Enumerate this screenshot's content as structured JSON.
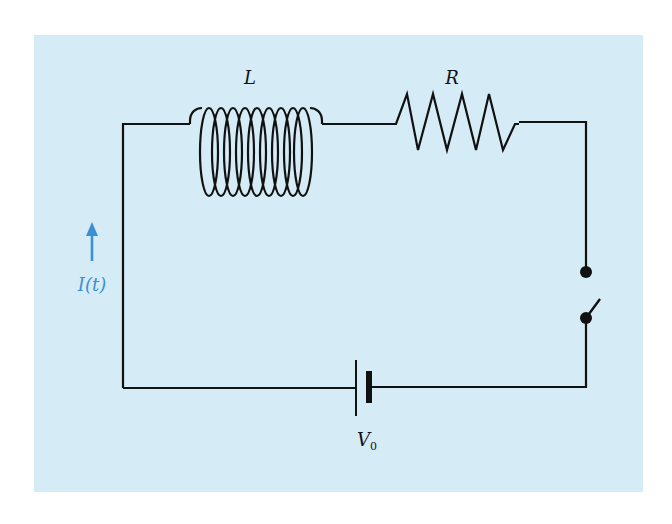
{
  "diagram": {
    "type": "circuit-schematic",
    "colors": {
      "background_panel": "#d5ecf7",
      "wire": "#111111",
      "current_arrow": "#3b8fd4",
      "page": "#ffffff"
    },
    "components": {
      "inductor": {
        "label": "L"
      },
      "resistor": {
        "label": "R"
      },
      "switch": {
        "state": "open"
      },
      "battery": {
        "label_main": "V",
        "label_sub": "0"
      }
    },
    "current": {
      "label": "I(t)",
      "direction": "up"
    }
  }
}
